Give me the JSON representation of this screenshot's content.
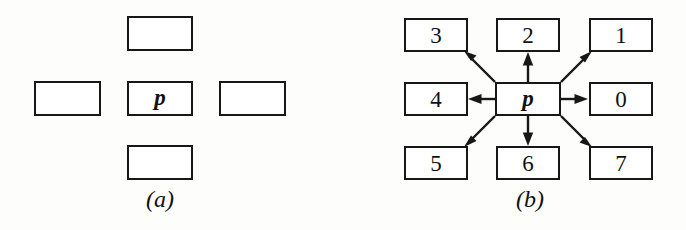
{
  "figure": {
    "background_color": "#fdfdfc",
    "ink_color": "#171717",
    "panels": [
      {
        "id": "a",
        "caption": "(a)",
        "center_label": "p",
        "cells": [
          {
            "name": "top-neighbor",
            "label": "",
            "x": 127,
            "y": 16,
            "w": 66,
            "h": 35
          },
          {
            "name": "left-neighbor",
            "label": "",
            "x": 34,
            "y": 81,
            "w": 67,
            "h": 35
          },
          {
            "name": "center-pixel",
            "label": "p",
            "x": 127,
            "y": 81,
            "w": 66,
            "h": 35
          },
          {
            "name": "right-neighbor",
            "label": "",
            "x": 219,
            "y": 81,
            "w": 67,
            "h": 35
          },
          {
            "name": "bottom-neighbor",
            "label": "",
            "x": 127,
            "y": 145,
            "w": 66,
            "h": 35
          }
        ],
        "caption_x": 100,
        "caption_y": 186
      },
      {
        "id": "b",
        "caption": "(b)",
        "center_label": "p",
        "cells": [
          {
            "name": "direction-3",
            "label": "3",
            "x": 61,
            "y": 18,
            "w": 64,
            "h": 34
          },
          {
            "name": "direction-2",
            "label": "2",
            "x": 153,
            "y": 18,
            "w": 64,
            "h": 34
          },
          {
            "name": "direction-1",
            "label": "1",
            "x": 246,
            "y": 18,
            "w": 64,
            "h": 34
          },
          {
            "name": "direction-4",
            "label": "4",
            "x": 61,
            "y": 82,
            "w": 64,
            "h": 34
          },
          {
            "name": "center-pixel",
            "label": "p",
            "x": 152,
            "y": 82,
            "w": 66,
            "h": 34
          },
          {
            "name": "direction-0",
            "label": "0",
            "x": 246,
            "y": 82,
            "w": 64,
            "h": 34
          },
          {
            "name": "direction-5",
            "label": "5",
            "x": 61,
            "y": 146,
            "w": 64,
            "h": 34
          },
          {
            "name": "direction-6",
            "label": "6",
            "x": 153,
            "y": 146,
            "w": 64,
            "h": 34
          },
          {
            "name": "direction-7",
            "label": "7",
            "x": 246,
            "y": 146,
            "w": 64,
            "h": 34
          }
        ],
        "arrows": [
          {
            "name": "arrow-to-1",
            "from": [
              218,
              82
            ],
            "to": [
              247,
              53
            ],
            "direction": "up-right"
          },
          {
            "name": "arrow-to-2",
            "from": [
              185,
              82
            ],
            "to": [
              185,
              55
            ],
            "direction": "up"
          },
          {
            "name": "arrow-to-3",
            "from": [
              152,
              82
            ],
            "to": [
              123,
              53
            ],
            "direction": "up-left"
          },
          {
            "name": "arrow-to-0",
            "from": [
              218,
              99
            ],
            "to": [
              244,
              99
            ],
            "direction": "right"
          },
          {
            "name": "arrow-to-4",
            "from": [
              152,
              99
            ],
            "to": [
              127,
              99
            ],
            "direction": "left"
          },
          {
            "name": "arrow-to-5",
            "from": [
              152,
              116
            ],
            "to": [
              123,
              145
            ],
            "direction": "down-left"
          },
          {
            "name": "arrow-to-6",
            "from": [
              185,
              116
            ],
            "to": [
              185,
              143
            ],
            "direction": "down"
          },
          {
            "name": "arrow-to-7",
            "from": [
              218,
              116
            ],
            "to": [
              247,
              145
            ],
            "direction": "down-right"
          }
        ],
        "caption_x": 127,
        "caption_y": 186
      }
    ]
  }
}
